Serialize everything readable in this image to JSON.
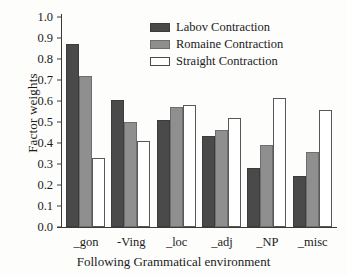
{
  "chart_data": {
    "type": "bar",
    "title": "",
    "xlabel": "Following Grammatical environment",
    "ylabel": "Factor weights",
    "categories": [
      "_gon",
      "-Ving",
      "_loc",
      "_adj",
      "_NP",
      "_misc"
    ],
    "series": [
      {
        "name": "Labov Contraction",
        "color": "#4a4a4a",
        "values": [
          0.87,
          0.605,
          0.51,
          0.435,
          0.28,
          0.245
        ]
      },
      {
        "name": "Romaine Contraction",
        "color": "#8f8f8f",
        "values": [
          0.72,
          0.5,
          0.57,
          0.46,
          0.39,
          0.355
        ]
      },
      {
        "name": "Straight Contraction",
        "color": "#ffffff",
        "values": [
          0.33,
          0.41,
          0.58,
          0.52,
          0.615,
          0.555
        ]
      }
    ],
    "ylim": [
      0.0,
      1.0
    ],
    "yticks": [
      "0.0",
      "0.1",
      "0.2",
      "0.3",
      "0.4",
      "0.5",
      "0.6",
      "0.7",
      "0.8",
      "0.9",
      "1.0"
    ],
    "ytick_values": [
      0.0,
      0.1,
      0.2,
      0.3,
      0.4,
      0.5,
      0.6,
      0.7,
      0.8,
      0.9,
      1.0
    ],
    "grid": false,
    "legend_position": "top-center"
  }
}
